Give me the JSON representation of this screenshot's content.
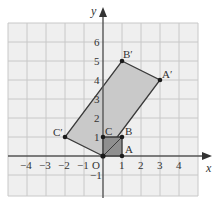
{
  "axes": {
    "x_label": "x",
    "y_label": "y",
    "origin_label": "O",
    "x_ticks": [
      "−4",
      "−3",
      "−2",
      "−1",
      "1",
      "2",
      "3",
      "4"
    ],
    "y_ticks": [
      "−1",
      "1",
      "2",
      "3",
      "4",
      "5",
      "6"
    ]
  },
  "shapes": {
    "original": {
      "name": "OABC",
      "vertices": [
        {
          "label": "O",
          "x": 0,
          "y": 0
        },
        {
          "label": "A",
          "x": 1,
          "y": 0
        },
        {
          "label": "B",
          "x": 1,
          "y": 1
        },
        {
          "label": "C",
          "x": 0,
          "y": 1
        }
      ]
    },
    "image": {
      "name": "OA′B′C′",
      "vertices": [
        {
          "label": "O",
          "x": 0,
          "y": 0
        },
        {
          "label": "A′",
          "x": 3,
          "y": 4
        },
        {
          "label": "B′",
          "x": 1,
          "y": 5
        },
        {
          "label": "C′",
          "x": -2,
          "y": 1
        }
      ]
    }
  },
  "labels": {
    "A": "A",
    "B": "B",
    "C": "C",
    "A_prime": "A′",
    "B_prime": "B′",
    "C_prime": "C′"
  },
  "colors": {
    "grid_bg": "#efefef",
    "grid_line": "#c8c8c8",
    "axis": "#555555",
    "image_fill": "#c9c9c9",
    "original_fill": "#8f8f8f",
    "edge": "#3a3a3a",
    "point": "#1a1a1a"
  }
}
